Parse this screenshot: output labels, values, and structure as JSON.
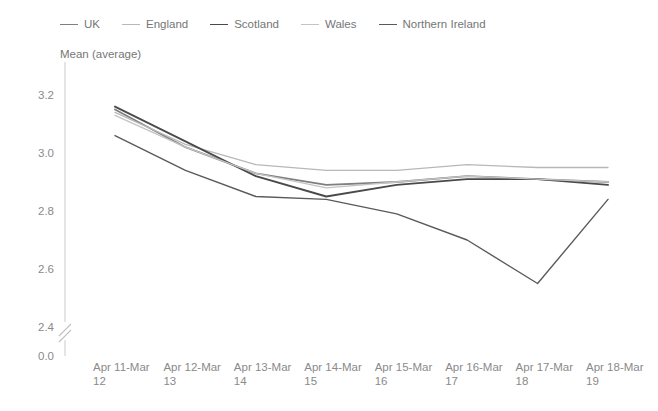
{
  "chart_data": {
    "type": "line",
    "title": "",
    "subtitle": "",
    "ylabel": "Mean (average)",
    "xlabel": "",
    "categories": [
      "Apr 11-Mar 12",
      "Apr 12-Mar 13",
      "Apr 13-Mar 14",
      "Apr 14-Mar 15",
      "Apr 15-Mar 16",
      "Apr 16-Mar 17",
      "Apr 17-Mar 18",
      "Apr 18-Mar 19"
    ],
    "ylim": [
      2.4,
      3.2
    ],
    "ytick_labels": [
      "0.0",
      "2.4",
      "2.6",
      "2.8",
      "3.0",
      "3.2"
    ],
    "axis_break": true,
    "grid": false,
    "legend_position": "top",
    "series": [
      {
        "name": "UK",
        "color": "#7f7f7f",
        "width": 1.8,
        "values": [
          3.15,
          3.02,
          2.93,
          2.89,
          2.9,
          2.92,
          2.91,
          2.9
        ]
      },
      {
        "name": "England",
        "color": "#b8b8b8",
        "width": 1.3,
        "values": [
          3.14,
          3.03,
          2.96,
          2.94,
          2.94,
          2.96,
          2.95,
          2.95
        ]
      },
      {
        "name": "Scotland",
        "color": "#4a4a4a",
        "width": 1.9,
        "values": [
          3.16,
          3.04,
          2.92,
          2.85,
          2.89,
          2.91,
          2.91,
          2.89
        ]
      },
      {
        "name": "Wales",
        "color": "#c4c4c4",
        "width": 1.3,
        "values": [
          3.13,
          3.02,
          2.93,
          2.88,
          2.9,
          2.92,
          2.91,
          2.9
        ]
      },
      {
        "name": "Northern Ireland",
        "color": "#5a5a5a",
        "width": 1.4,
        "values": [
          3.06,
          2.94,
          2.85,
          2.84,
          2.79,
          2.7,
          2.55,
          2.84
        ]
      }
    ]
  },
  "legend": {
    "items": [
      {
        "label": "UK"
      },
      {
        "label": "England"
      },
      {
        "label": "Scotland"
      },
      {
        "label": "Wales"
      },
      {
        "label": "Northern Ireland"
      }
    ]
  }
}
